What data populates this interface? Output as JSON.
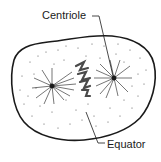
{
  "diagram": {
    "labels": {
      "centriole": "Centriole",
      "equator": "Equator"
    },
    "colors": {
      "stroke": "#1a1a1a",
      "background": "#ffffff",
      "chromosome": "#4a4a4a"
    },
    "structures": [
      {
        "name": "cell-membrane"
      },
      {
        "name": "centriole-left"
      },
      {
        "name": "centriole-right"
      },
      {
        "name": "spindle-fibers"
      },
      {
        "name": "chromosomes-at-equator"
      },
      {
        "name": "cytoplasm-dots"
      }
    ]
  }
}
